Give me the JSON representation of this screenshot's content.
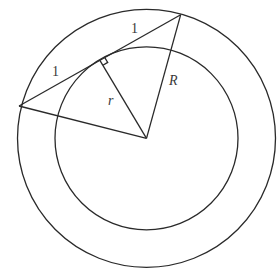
{
  "diagram": {
    "colors": {
      "stroke": "#2a2a2a",
      "label": "#3a3a3a",
      "background": "#ffffff"
    },
    "geometry": {
      "center": [
        146.5,
        138.3
      ],
      "outer_radius": 129,
      "inner_radius": 91.5,
      "chord_start": [
        19,
        106
      ],
      "chord_end": [
        180.7,
        14.7
      ],
      "tangent_point": [
        99.9,
        60.4
      ]
    },
    "labels": {
      "segment_left": "1",
      "segment_right": "1",
      "inner_radius": "r",
      "outer_radius": "R"
    },
    "markers": {
      "right_angle": "right-angle-square at tangent point"
    }
  }
}
